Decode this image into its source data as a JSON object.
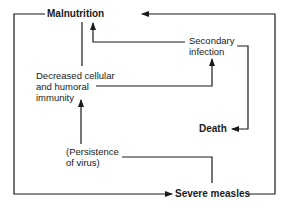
{
  "diagram": {
    "type": "flow-cycle",
    "nodes": {
      "malnutrition": "Malnutrition",
      "secondary_infection_1": "Secondary",
      "secondary_infection_2": "infection",
      "immunity_1": "Decreased cellular",
      "immunity_2": "and humoral",
      "immunity_3": "immunity",
      "persistence_1": "(Persistence",
      "persistence_2": "of virus)",
      "death": "Death",
      "severe_measles": "Severe measles"
    },
    "edges": [
      {
        "from": "Severe measles",
        "to": "Malnutrition"
      },
      {
        "from": "Malnutrition",
        "to": "Severe measles"
      },
      {
        "from": "Malnutrition",
        "to": "Decreased cellular and humoral immunity"
      },
      {
        "from": "Decreased cellular and humoral immunity",
        "to": "Secondary infection"
      },
      {
        "from": "Secondary infection",
        "to": "Malnutrition"
      },
      {
        "from": "Secondary infection",
        "to": "Death"
      },
      {
        "from": "(Persistence of virus)",
        "to": "Decreased cellular and humoral immunity"
      },
      {
        "from": "(Persistence of virus)",
        "to": "Severe measles"
      }
    ],
    "colors": {
      "line": "#1a1a1a",
      "background": "#ffffff"
    }
  }
}
